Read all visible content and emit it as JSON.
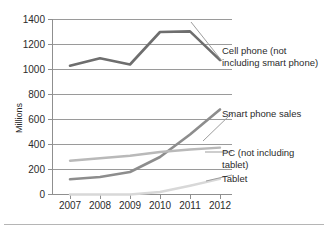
{
  "chart_data": {
    "type": "line",
    "title": "",
    "xlabel": "",
    "ylabel": "Millions",
    "categories": [
      "2007",
      "2008",
      "2009",
      "2010",
      "2011",
      "2012"
    ],
    "x": [
      2007,
      2008,
      2009,
      2010,
      2011,
      2012
    ],
    "ylim": [
      0,
      1400
    ],
    "yticks": [
      0,
      200,
      400,
      600,
      800,
      1000,
      1200,
      1400
    ],
    "ytick_labels": [
      "0",
      "200",
      "400",
      "600",
      "800",
      "1000",
      "1200",
      "1400"
    ],
    "grid": true,
    "legend_position": "inline-right",
    "series": [
      {
        "name": "Cell phone (not including smart phone)",
        "label_line_1": "Cell phone (not",
        "label_line_2": "including smart phone)",
        "color": "#6e6e6e",
        "values": [
          1030,
          1090,
          1040,
          1300,
          1305,
          1075
        ]
      },
      {
        "name": "Smart phone sales",
        "label_line_1": "Smart phone sales",
        "label_line_2": "",
        "color": "#8d8d8d",
        "values": [
          122,
          140,
          180,
          300,
          480,
          680
        ]
      },
      {
        "name": "PC (not including tablet)",
        "label_line_1": "PC (not including",
        "label_line_2": "tablet)",
        "color": "#b9b9b9",
        "values": [
          270,
          290,
          310,
          340,
          360,
          375
        ]
      },
      {
        "name": "Tablet",
        "label_line_1": "Tablet",
        "label_line_2": "",
        "color": "#d8d8d8",
        "values": [
          0,
          0,
          0,
          20,
          70,
          125
        ]
      }
    ]
  },
  "axis": {
    "y_title": "Millions",
    "y_labels": [
      "1400",
      "1200",
      "1000",
      "800",
      "600",
      "400",
      "200",
      "0"
    ],
    "x_labels": [
      "2007",
      "2008",
      "2009",
      "2010",
      "2011",
      "2012"
    ]
  },
  "labels": {
    "cell_phone_line1": "Cell phone (not",
    "cell_phone_line2": "including smart phone)",
    "smart_phone": "Smart phone sales",
    "pc_line1": "PC (not including",
    "pc_line2": "tablet)",
    "tablet": "Tablet"
  }
}
